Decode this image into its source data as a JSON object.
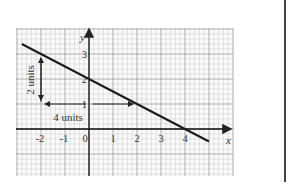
{
  "chart_data": {
    "type": "line",
    "title": "",
    "xlabel": "x",
    "ylabel": "y",
    "xlim": [
      -3,
      6
    ],
    "ylim": [
      -1.9,
      4
    ],
    "grid": true,
    "x_ticks": [
      "-2",
      "-1",
      "0",
      "1",
      "2",
      "3",
      "4"
    ],
    "y_ticks": [
      "1",
      "2",
      "3"
    ],
    "series": [
      {
        "name": "line",
        "x": [
          -2.8,
          -2,
          0,
          2,
          4,
          5
        ],
        "y": [
          3.4,
          3,
          2,
          1,
          0,
          -0.5
        ]
      }
    ],
    "annotations": [
      {
        "text": "2 units",
        "type": "vertical-arrow",
        "x": -2,
        "from_y": 1,
        "to_y": 3
      },
      {
        "text": "4 units",
        "type": "horizontal-arrow",
        "y": 1,
        "from_x": -2,
        "to_x": 2
      }
    ],
    "y_intercept": 2,
    "x_intercept": 4,
    "gradient": -0.5
  },
  "labels": {
    "x_axis": "x",
    "y_axis": "y",
    "rise": "2 units",
    "run": "4 units",
    "tick_x": [
      "-2",
      "-1",
      "0",
      "1",
      "2",
      "3",
      "4"
    ],
    "tick_y": [
      "1",
      "2",
      "3"
    ]
  }
}
